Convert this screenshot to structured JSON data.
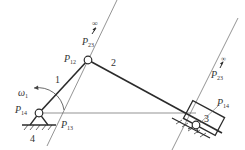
{
  "diagram": {
    "type": "mechanism-kinematic-diagram",
    "links": [
      {
        "id": "1",
        "label": "1",
        "role": "crank"
      },
      {
        "id": "2",
        "label": "2",
        "role": "coupler"
      },
      {
        "id": "3",
        "label": "3",
        "role": "slider"
      },
      {
        "id": "4",
        "label": "4",
        "role": "ground"
      }
    ],
    "angular_velocity": {
      "symbol": "ω",
      "subscript": "1"
    },
    "instant_centers": [
      {
        "id": "P12",
        "main": "P",
        "sub": "12"
      },
      {
        "id": "P14",
        "main": "P",
        "sub": "14"
      },
      {
        "id": "P13",
        "main": "P",
        "sub": "13"
      },
      {
        "id": "P23_left",
        "main": "P",
        "sub": "23",
        "infinity": "∞"
      },
      {
        "id": "P23_right",
        "main": "P",
        "sub": "23",
        "infinity": "∞"
      },
      {
        "id": "P34",
        "main": "P",
        "sub": "14"
      }
    ],
    "colors": {
      "thick_line": "#2b2b2b",
      "thin_line": "#555555",
      "label": "#333333"
    }
  }
}
